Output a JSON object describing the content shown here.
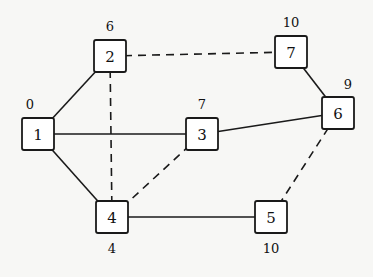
{
  "graph": {
    "nodes": [
      {
        "id": "1",
        "x": 38,
        "y": 134,
        "weight": "0",
        "wx": 30,
        "wy": 104
      },
      {
        "id": "2",
        "x": 110,
        "y": 56,
        "weight": "6",
        "wx": 110,
        "wy": 26
      },
      {
        "id": "3",
        "x": 202,
        "y": 134,
        "weight": "7",
        "wx": 202,
        "wy": 104
      },
      {
        "id": "4",
        "x": 112,
        "y": 217,
        "weight": "4",
        "wx": 112,
        "wy": 248
      },
      {
        "id": "5",
        "x": 271,
        "y": 217,
        "weight": "10",
        "wx": 271,
        "wy": 248
      },
      {
        "id": "6",
        "x": 338,
        "y": 113,
        "weight": "9",
        "wx": 348,
        "wy": 84
      },
      {
        "id": "7",
        "x": 291,
        "y": 52,
        "weight": "10",
        "wx": 291,
        "wy": 22
      }
    ],
    "edges": [
      {
        "from": "1",
        "to": "2",
        "style": "solid"
      },
      {
        "from": "1",
        "to": "3",
        "style": "solid"
      },
      {
        "from": "1",
        "to": "4",
        "style": "solid"
      },
      {
        "from": "3",
        "to": "6",
        "style": "solid"
      },
      {
        "from": "4",
        "to": "5",
        "style": "solid"
      },
      {
        "from": "7",
        "to": "6",
        "style": "solid"
      },
      {
        "from": "2",
        "to": "7",
        "style": "dashed"
      },
      {
        "from": "2",
        "to": "4",
        "style": "dashed"
      },
      {
        "from": "4",
        "to": "3",
        "style": "dashed"
      },
      {
        "from": "5",
        "to": "6",
        "style": "dashed"
      }
    ],
    "node_size": 32
  }
}
